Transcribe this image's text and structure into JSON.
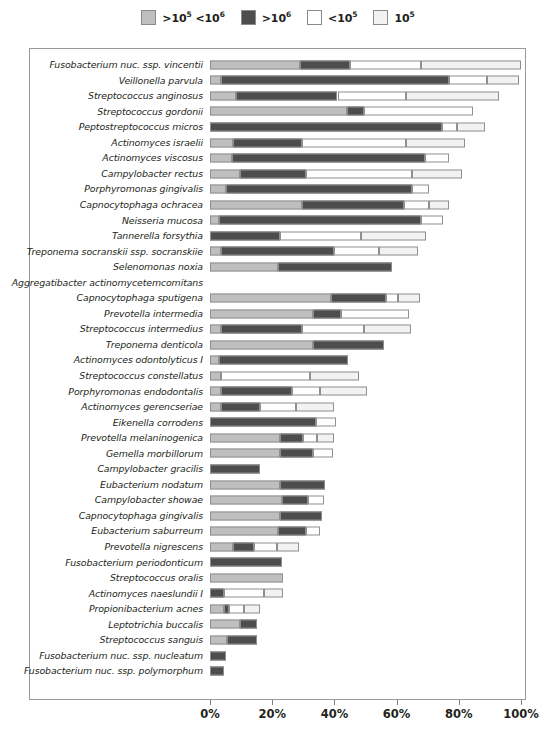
{
  "chart_data": {
    "type": "bar",
    "subtype": "stacked-horizontal",
    "title": "",
    "xlabel": "",
    "ylabel": "",
    "xlim": [
      0,
      100
    ],
    "xticks": [
      0,
      20,
      40,
      60,
      80,
      100
    ],
    "xtick_labels": [
      "0%",
      "20%",
      "40%",
      "60%",
      "80%",
      "100%"
    ],
    "grid": false,
    "legend_position": "top-center",
    "series": [
      {
        "name": ">10⁵ <10⁶",
        "key": "s1",
        "color": "#bfbfbf"
      },
      {
        "name": ">10⁶",
        "key": "s2",
        "color": "#4d4d4d"
      },
      {
        "name": "<10⁵",
        "key": "s3",
        "color": "#ffffff"
      },
      {
        "name": "10⁵",
        "key": "s4",
        "color": "#f2f2f2"
      }
    ],
    "categories": [
      "Fusobacterium nuc. ssp. vincentii",
      "Veillonella parvula",
      "Streptococcus anginosus",
      "Streptococcus gordonii",
      "Peptostreptococcus micros",
      "Actinomyces israelii",
      "Actinomyces viscosus",
      "Campylobacter rectus",
      "Porphyromonas gingivalis",
      "Capnocytophaga ochracea",
      "Neisseria mucosa",
      "Tannerella forsythia",
      "Treponema socranskii ssp. socranskiie",
      "Selenomonas noxia",
      "Aggregatibacter actinomycetemcomitans",
      "Capnocytophaga sputigena",
      "Prevotella intermedia",
      "Streptococcus intermedius",
      "Treponema denticola",
      "Actinomyces odontolyticus I",
      "Streptococcus constellatus",
      "Porphyromonas endodontalis",
      "Actinomyces gerencseriae",
      "Eikenella corrodens",
      "Prevotella melaninogenica",
      "Gemella morbillorum",
      "Campylobacter gracilis",
      "Eubacterium nodatum",
      "Campylobacter showae",
      "Capnocytophaga gingivalis",
      "Eubacterium saburreum",
      "Prevotella nigrescens",
      "Fusobacterium periodonticum",
      "Streptococcus oralis",
      "Actinomyces naeslundii I",
      "Propionibacterium acnes",
      "Leptotrichia buccalis",
      "Streptococcus sanguis",
      "Fusobacterium nuc. ssp. nucleatum",
      "Fusobacterium nuc. ssp. polymorphum"
    ],
    "values": [
      {
        "category": "Fusobacterium nuc. ssp. vincentii",
        "s1": 29.0,
        "s2": 16.0,
        "s3": 23.0,
        "s4": 32.0,
        "total": 100.0
      },
      {
        "category": "Veillonella parvula",
        "s1": 3.5,
        "s2": 73.5,
        "s3": 12.0,
        "s4": 10.5,
        "total": 99.5
      },
      {
        "category": "Streptococcus anginosus",
        "s1": 8.5,
        "s2": 32.5,
        "s3": 22.0,
        "s4": 30.0,
        "total": 93.0
      },
      {
        "category": "Streptococcus gordonii",
        "s1": 44.0,
        "s2": 5.5,
        "s3": 35.0,
        "s4": 0.0,
        "total": 84.5
      },
      {
        "category": "Peptostreptococcus micros",
        "s1": 0.0,
        "s2": 74.5,
        "s3": 5.0,
        "s4": 9.0,
        "total": 88.5
      },
      {
        "category": "Actinomyces israelii",
        "s1": 7.5,
        "s2": 22.0,
        "s3": 33.5,
        "s4": 19.0,
        "total": 82.0
      },
      {
        "category": "Actinomyces viscosus",
        "s1": 7.0,
        "s2": 62.0,
        "s3": 8.0,
        "s4": 0.0,
        "total": 77.0
      },
      {
        "category": "Campylobacter rectus",
        "s1": 9.5,
        "s2": 21.5,
        "s3": 34.0,
        "s4": 16.0,
        "total": 81.0
      },
      {
        "category": "Porphyromonas gingivalis",
        "s1": 5.0,
        "s2": 60.0,
        "s3": 5.5,
        "s4": 0.0,
        "total": 70.5
      },
      {
        "category": "Capnocytophaga ochracea",
        "s1": 29.5,
        "s2": 33.0,
        "s3": 8.0,
        "s4": 6.5,
        "total": 77.0
      },
      {
        "category": "Neisseria mucosa",
        "s1": 3.0,
        "s2": 65.0,
        "s3": 7.0,
        "s4": 0.0,
        "total": 75.0
      },
      {
        "category": "Tannerella forsythia",
        "s1": 0.0,
        "s2": 22.5,
        "s3": 26.0,
        "s4": 21.0,
        "total": 69.5
      },
      {
        "category": "Treponema socranskii ssp. socranskiie",
        "s1": 3.5,
        "s2": 36.5,
        "s3": 14.5,
        "s4": 12.5,
        "total": 67.0
      },
      {
        "category": "Selenomonas noxia",
        "s1": 22.0,
        "s2": 36.5,
        "s3": 0.0,
        "s4": 0.0,
        "total": 58.5
      },
      {
        "category": "Aggregatibacter actinomycetemcomitans",
        "s1": 0.0,
        "s2": 0.0,
        "s3": 0.0,
        "s4": 0.0,
        "total": 0.0
      },
      {
        "category": "Capnocytophaga sputigena",
        "s1": 39.0,
        "s2": 17.5,
        "s3": 4.0,
        "s4": 7.0,
        "total": 67.5
      },
      {
        "category": "Prevotella intermedia",
        "s1": 33.0,
        "s2": 9.0,
        "s3": 22.0,
        "s4": 0.0,
        "total": 64.0
      },
      {
        "category": "Streptococcus intermedius",
        "s1": 3.5,
        "s2": 26.0,
        "s3": 20.0,
        "s4": 15.0,
        "total": 64.5
      },
      {
        "category": "Treponema denticola",
        "s1": 33.0,
        "s2": 23.0,
        "s3": 0.0,
        "s4": 0.0,
        "total": 56.0
      },
      {
        "category": "Actinomyces odontolyticus I",
        "s1": 3.0,
        "s2": 41.5,
        "s3": 0.0,
        "s4": 0.0,
        "total": 44.5
      },
      {
        "category": "Streptococcus constellatus",
        "s1": 3.5,
        "s2": 0.0,
        "s3": 28.5,
        "s4": 16.0,
        "total": 48.0
      },
      {
        "category": "Porphyromonas endodontalis",
        "s1": 3.5,
        "s2": 23.0,
        "s3": 9.0,
        "s4": 15.0,
        "total": 50.5
      },
      {
        "category": "Actinomyces gerencseriae",
        "s1": 3.5,
        "s2": 12.5,
        "s3": 11.5,
        "s4": 12.5,
        "total": 40.0
      },
      {
        "category": "Eikenella corrodens",
        "s1": 0.0,
        "s2": 34.0,
        "s3": 6.5,
        "s4": 0.0,
        "total": 40.5
      },
      {
        "category": "Prevotella melaninogenica",
        "s1": 22.5,
        "s2": 7.5,
        "s3": 4.5,
        "s4": 5.5,
        "total": 40.0
      },
      {
        "category": "Gemella morbillorum",
        "s1": 22.5,
        "s2": 10.5,
        "s3": 6.5,
        "s4": 0.0,
        "total": 39.5
      },
      {
        "category": "Campylobacter gracilis",
        "s1": 0.0,
        "s2": 16.0,
        "s3": 0.0,
        "s4": 0.0,
        "total": 16.0
      },
      {
        "category": "Eubacterium nodatum",
        "s1": 22.5,
        "s2": 14.5,
        "s3": 0.0,
        "s4": 0.0,
        "total": 37.0
      },
      {
        "category": "Campylobacter showae",
        "s1": 23.0,
        "s2": 8.5,
        "s3": 5.0,
        "s4": 0.0,
        "total": 36.5
      },
      {
        "category": "Capnocytophaga gingivalis",
        "s1": 22.5,
        "s2": 13.5,
        "s3": 0.0,
        "s4": 0.0,
        "total": 36.0
      },
      {
        "category": "Eubacterium saburreum",
        "s1": 22.0,
        "s2": 9.0,
        "s3": 4.5,
        "s4": 0.0,
        "total": 35.5
      },
      {
        "category": "Prevotella nigrescens",
        "s1": 7.5,
        "s2": 6.5,
        "s3": 7.5,
        "s4": 7.0,
        "total": 28.5
      },
      {
        "category": "Fusobacterium periodonticum",
        "s1": 0.0,
        "s2": 23.0,
        "s3": 0.0,
        "s4": 0.0,
        "total": 23.0
      },
      {
        "category": "Streptococcus oralis",
        "s1": 23.5,
        "s2": 0.0,
        "s3": 0.0,
        "s4": 0.0,
        "total": 23.5
      },
      {
        "category": "Actinomyces naeslundii I",
        "s1": 0.0,
        "s2": 4.5,
        "s3": 13.0,
        "s4": 6.0,
        "total": 23.5
      },
      {
        "category": "Propionibacterium acnes",
        "s1": 4.5,
        "s2": 1.5,
        "s3": 5.0,
        "s4": 5.0,
        "total": 16.0
      },
      {
        "category": "Leptotrichia buccalis",
        "s1": 9.5,
        "s2": 5.5,
        "s3": 0.0,
        "s4": 0.0,
        "total": 15.0
      },
      {
        "category": "Streptococcus sanguis",
        "s1": 5.5,
        "s2": 9.5,
        "s3": 0.0,
        "s4": 0.0,
        "total": 15.0
      },
      {
        "category": "Fusobacterium nuc. ssp. nucleatum",
        "s1": 0.0,
        "s2": 5.0,
        "s3": 0.0,
        "s4": 0.0,
        "total": 5.0
      },
      {
        "category": "Fusobacterium nuc. ssp. polymorphum",
        "s1": 0.0,
        "s2": 4.5,
        "s3": 0.0,
        "s4": 0.0,
        "total": 4.5
      }
    ]
  }
}
